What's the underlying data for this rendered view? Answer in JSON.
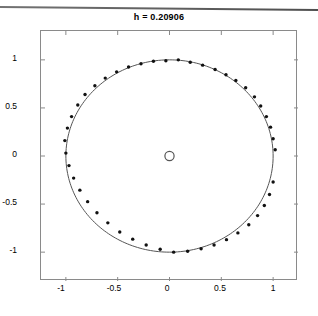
{
  "figure": {
    "title": "h = 0.20906",
    "background_color": "#ffffff",
    "axis_color": "#8a8a8a",
    "marker_color": "#111111",
    "curve_color": "#555555"
  },
  "chart_data": {
    "type": "scatter",
    "title": "h = 0.20906",
    "xlabel": "",
    "ylabel": "",
    "xlim": [
      -1.24,
      1.24
    ],
    "ylim": [
      -1.3,
      1.3
    ],
    "grid": false,
    "legend": null,
    "xticks": [
      -1,
      -0.5,
      0,
      0.5,
      1
    ],
    "xtick_labels": [
      "-1",
      "-0.5",
      "0",
      "0.5",
      "1"
    ],
    "yticks": [
      -1,
      -0.5,
      0,
      0.5,
      1
    ],
    "ytick_labels": [
      "-1",
      "-0.5",
      "0",
      "0.5",
      "1"
    ],
    "series": [
      {
        "name": "unit-circle",
        "type": "line",
        "marker": "none",
        "linestyle": "solid",
        "color": "#555555",
        "description": "unit circle, radius 1 centred at origin"
      },
      {
        "name": "origin-marker",
        "type": "scatter",
        "marker": "o",
        "filled": false,
        "color": "#555555",
        "x": [
          0
        ],
        "y": [
          0
        ]
      },
      {
        "name": "eigenvalues",
        "type": "scatter",
        "marker": ".",
        "filled": true,
        "color": "#111111",
        "x": [
          1.02,
          1.0,
          0.975,
          0.935,
          0.88,
          0.82,
          0.735,
          0.64,
          0.545,
          0.44,
          0.32,
          0.2,
          0.085,
          -0.035,
          -0.155,
          -0.275,
          -0.395,
          -0.51,
          -0.62,
          -0.72,
          -0.815,
          -0.885,
          -0.945,
          -0.985,
          -1.01,
          -1.0,
          -0.97,
          -0.925,
          -0.865,
          -0.79,
          -0.7,
          -0.595,
          -0.48,
          -0.355,
          -0.225,
          -0.09,
          0.04,
          0.175,
          0.305,
          0.43,
          0.55,
          0.66,
          0.765,
          0.85,
          0.915,
          0.965,
          1.0
        ],
        "y": [
          0.065,
          0.18,
          0.3,
          0.41,
          0.52,
          0.615,
          0.71,
          0.785,
          0.845,
          0.9,
          0.945,
          0.975,
          1.0,
          0.99,
          0.985,
          0.96,
          0.925,
          0.875,
          0.81,
          0.73,
          0.64,
          0.53,
          0.41,
          0.29,
          0.16,
          0.03,
          -0.1,
          -0.23,
          -0.355,
          -0.475,
          -0.59,
          -0.695,
          -0.79,
          -0.865,
          -0.925,
          -0.97,
          -1.0,
          -0.99,
          -0.965,
          -0.925,
          -0.87,
          -0.8,
          -0.715,
          -0.62,
          -0.515,
          -0.4,
          -0.27
        ],
        "count": 47,
        "description": "points distributed around the unit circle, alternating slightly inside and outside"
      }
    ]
  }
}
